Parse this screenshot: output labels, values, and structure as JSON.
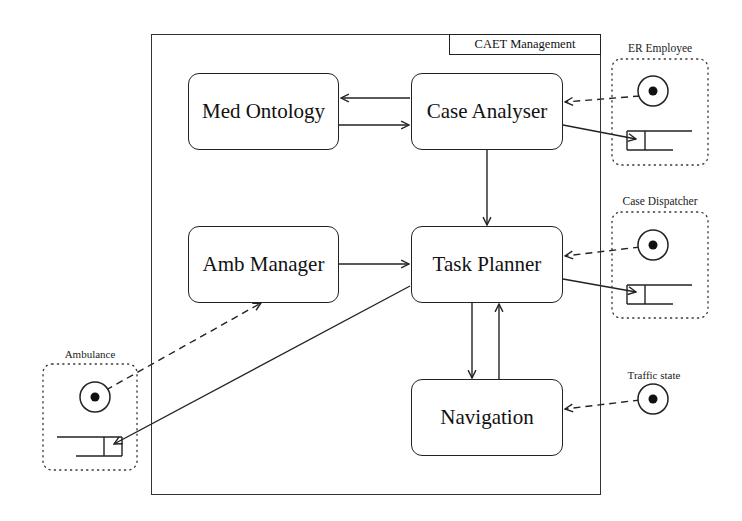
{
  "diagram": {
    "container": {
      "title": "CAET Management"
    },
    "components": [
      {
        "id": "med-ontology",
        "label": "Med Ontology"
      },
      {
        "id": "case-analyser",
        "label": "Case Analyser"
      },
      {
        "id": "amb-manager",
        "label": "Amb Manager"
      },
      {
        "id": "task-planner",
        "label": "Task Planner"
      },
      {
        "id": "navigation",
        "label": "Navigation"
      }
    ],
    "external_agents": [
      {
        "id": "er-employee",
        "label": "ER Employee",
        "has_input_port": true,
        "has_output_queue": true
      },
      {
        "id": "case-dispatcher",
        "label": "Case Dispatcher",
        "has_input_port": true,
        "has_output_queue": true
      },
      {
        "id": "traffic-state",
        "label": "Traffic state",
        "has_input_port": true,
        "has_output_queue": false
      },
      {
        "id": "ambulance",
        "label": "Ambulance",
        "has_input_port": true,
        "has_output_queue": true
      }
    ],
    "edges": [
      {
        "from": "case-analyser",
        "to": "med-ontology",
        "style": "solid"
      },
      {
        "from": "med-ontology",
        "to": "case-analyser",
        "style": "solid"
      },
      {
        "from": "case-analyser",
        "to": "task-planner",
        "style": "solid"
      },
      {
        "from": "amb-manager",
        "to": "task-planner",
        "style": "solid"
      },
      {
        "from": "task-planner",
        "to": "navigation",
        "style": "solid"
      },
      {
        "from": "navigation",
        "to": "task-planner",
        "style": "solid"
      },
      {
        "from": "er-employee",
        "to": "case-analyser",
        "style": "dashed"
      },
      {
        "from": "case-analyser",
        "to": "er-employee",
        "style": "solid"
      },
      {
        "from": "case-dispatcher",
        "to": "task-planner",
        "style": "dashed"
      },
      {
        "from": "task-planner",
        "to": "case-dispatcher",
        "style": "solid"
      },
      {
        "from": "traffic-state",
        "to": "navigation",
        "style": "dashed"
      },
      {
        "from": "ambulance",
        "to": "amb-manager",
        "style": "dashed"
      },
      {
        "from": "task-planner",
        "to": "ambulance",
        "style": "solid"
      }
    ],
    "colors": {
      "stroke": "#222222",
      "background": "#ffffff"
    }
  }
}
